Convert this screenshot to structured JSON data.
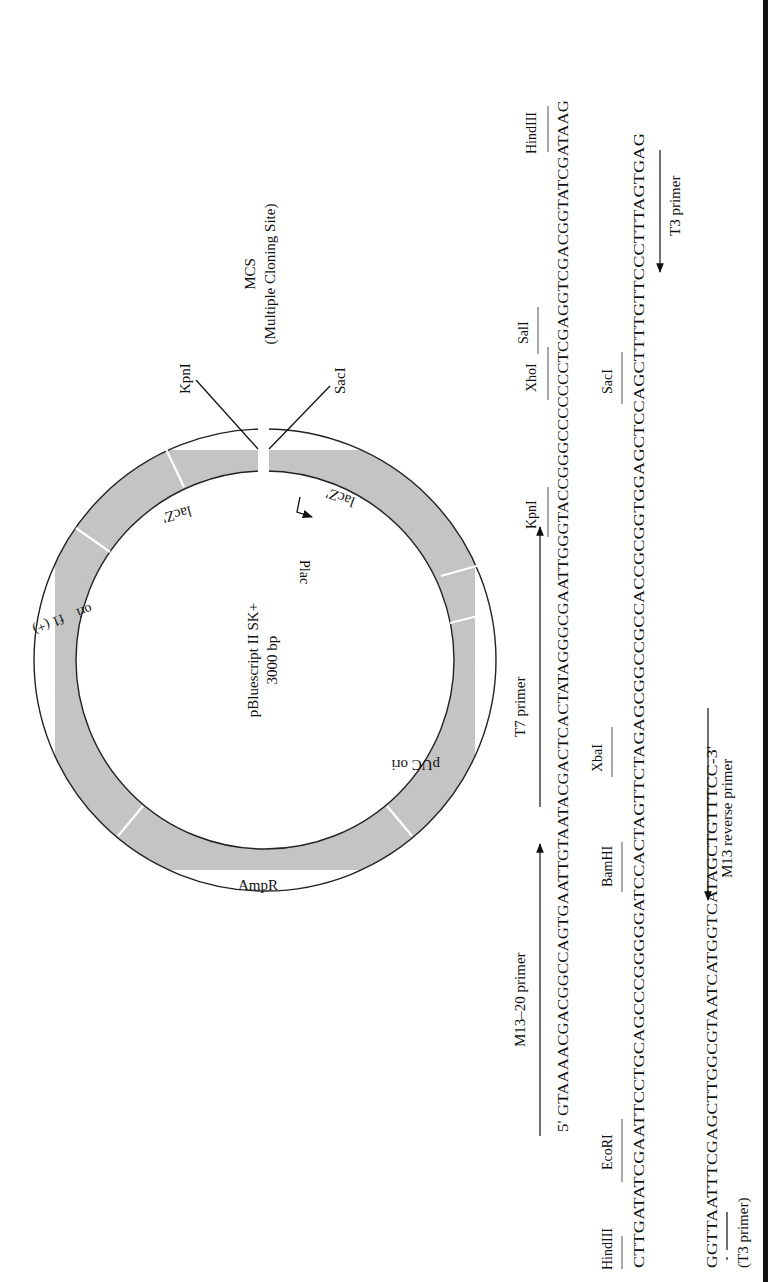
{
  "plasmid": {
    "name": "pBluescript II SK+",
    "size": "3000 bp",
    "ring_color": "#c8c8c8",
    "segments": [
      {
        "label": "lacZ'",
        "position": "left of MCS"
      },
      {
        "label": "lacZ'",
        "position": "right of MCS"
      },
      {
        "label": "pUC ori"
      },
      {
        "label": "AmpR"
      },
      {
        "label": "f1 (+)",
        "label2": "ori"
      }
    ],
    "promoter": "Plac",
    "mcs": {
      "title": "MCS",
      "subtitle": "(Multiple Cloning Site)",
      "left_site": "KpnI",
      "right_site": "SacI"
    }
  },
  "sequence": {
    "line1": {
      "text": "5' GTAAAACGACGGCCAGTGAATTGTAATACGACTCACTATAGGGCGAATTGGGTACCGGGCCCCCCCTCGAGGTCGACGGTATCGATAAG",
      "sites": [
        "KpnI",
        "XhoI",
        "SalI",
        "HindIII"
      ],
      "primers": [
        "M13–20 primer",
        "T7 primer"
      ]
    },
    "line2": {
      "text": "CTTGATATCGAATTCCTGCAGCCCGGGGGATCCACTAGTTCTAGAGCGGCCGCCACCGCGGTGGAGCTCCAGCTTTTGTTCCCTTTAGTGAG",
      "sites": [
        "HindIII",
        "EcoRI",
        "BamHI",
        "XbaI",
        "SacI"
      ],
      "primers": [
        "T3 primer"
      ]
    },
    "line3": {
      "text": "GGTTAATTTCGAGCTTGGCGTAATCATGGTCATAGCTGTTTCC-3'",
      "primers": [
        "(T3 primer)",
        "M13 reverse primer"
      ]
    }
  }
}
